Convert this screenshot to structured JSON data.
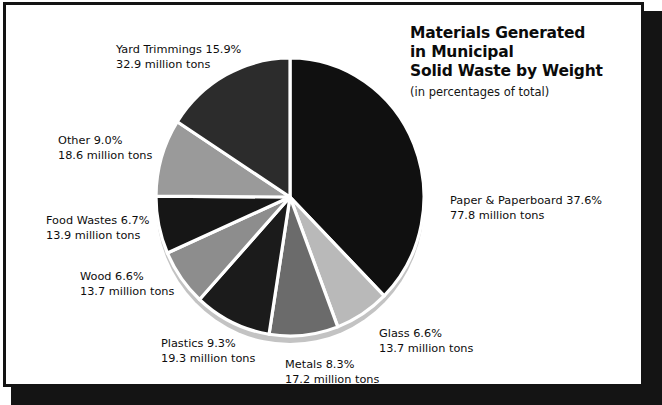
{
  "title": {
    "line1": "Materials Generated",
    "line2": "in Municipal",
    "line3": "Solid Waste by Weight",
    "subtitle": "(in percentages of total)"
  },
  "labels": {
    "paper": {
      "line1": "Paper & Paperboard 37.6%",
      "line2": "77.8 million tons"
    },
    "glass": {
      "line1": "Glass 6.6%",
      "line2": "13.7 million tons"
    },
    "metals": {
      "line1": "Metals 8.3%",
      "line2": "17.2 million tons"
    },
    "plastics": {
      "line1": "Plastics 9.3%",
      "line2": "19.3 million tons"
    },
    "wood": {
      "line1": "Wood 6.6%",
      "line2": "13.7 million tons"
    },
    "food": {
      "line1": "Food Wastes 6.7%",
      "line2": "13.9 million tons"
    },
    "other": {
      "line1": "Other 9.0%",
      "line2": "18.6 million tons"
    },
    "yard": {
      "line1": "Yard Trimmings 15.9%",
      "line2": "32.9 million tons"
    }
  },
  "chart_data": {
    "type": "pie",
    "title": "Materials Generated in Municipal Solid Waste by Weight",
    "subtitle": "(in percentages of total)",
    "unit": "million tons",
    "value_label": "percent of total",
    "total_tons": 207.1,
    "start_angle_deg": -90,
    "direction": "clockwise",
    "categories": [
      "Paper & Paperboard",
      "Glass",
      "Metals",
      "Plastics",
      "Wood",
      "Food Wastes",
      "Other",
      "Yard Trimmings"
    ],
    "values": [
      37.6,
      6.6,
      8.3,
      9.3,
      6.6,
      6.7,
      9.0,
      15.9
    ],
    "tons": [
      77.8,
      13.7,
      17.2,
      19.3,
      13.7,
      13.9,
      18.6,
      32.9
    ],
    "colors": [
      "#101010",
      "#b9b9b9",
      "#6b6b6b",
      "#1b1b1b",
      "#8d8d8d",
      "#161616",
      "#9a9a9a",
      "#2c2c2c"
    ],
    "slice_separator_color": "#ffffff",
    "rim_color": "#c3c3c3",
    "legend": "callout-labels",
    "grid": false
  },
  "frame": {
    "border_color": "#131313",
    "shadow_color": "#141414",
    "background": "#ffffff"
  }
}
